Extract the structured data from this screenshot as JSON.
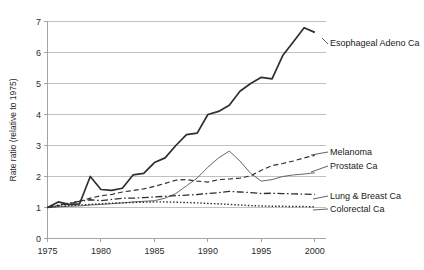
{
  "chart_data": {
    "type": "line",
    "title": "",
    "xlabel": "",
    "ylabel": "Rate ratio (relative to 1975)",
    "xlim": [
      1975,
      2001
    ],
    "ylim": [
      0,
      7
    ],
    "grid": true,
    "legend_position": "right-inline-labels",
    "x_ticks": [
      "1975",
      "1980",
      "1985",
      "1990",
      "1995",
      "2000"
    ],
    "x_tick_values": [
      1975,
      1980,
      1985,
      1990,
      1995,
      2000
    ],
    "y_ticks": [
      "0",
      "1",
      "2",
      "3",
      "4",
      "5",
      "6",
      "7"
    ],
    "y_tick_values": [
      0,
      1,
      2,
      3,
      4,
      5,
      6,
      7
    ],
    "x": [
      1975,
      1976,
      1977,
      1978,
      1979,
      1980,
      1981,
      1982,
      1983,
      1984,
      1985,
      1986,
      1987,
      1988,
      1989,
      1990,
      1991,
      1992,
      1993,
      1994,
      1995,
      1996,
      1997,
      1998,
      1999,
      2000
    ],
    "series": [
      {
        "name": "Esophageal Adeno Ca",
        "style": "solid",
        "color": "#2f2f2f",
        "width": 1.7,
        "label": "Esophageal Adeno Ca",
        "values": [
          1.0,
          1.18,
          1.1,
          1.12,
          2.0,
          1.58,
          1.55,
          1.62,
          2.05,
          2.1,
          2.45,
          2.6,
          3.0,
          3.35,
          3.4,
          4.0,
          4.1,
          4.3,
          4.75,
          5.0,
          5.2,
          5.15,
          5.9,
          6.35,
          6.8,
          6.65
        ]
      },
      {
        "name": "Melanoma",
        "style": "dashed",
        "color": "#2f2f2f",
        "width": 1.2,
        "label": "Melanoma",
        "values": [
          1.0,
          1.06,
          1.12,
          1.2,
          1.3,
          1.38,
          1.42,
          1.5,
          1.55,
          1.6,
          1.68,
          1.78,
          1.88,
          1.9,
          1.85,
          1.82,
          1.9,
          1.92,
          1.95,
          2.02,
          2.2,
          2.35,
          2.42,
          2.5,
          2.6,
          2.68
        ]
      },
      {
        "name": "Prostate Ca",
        "style": "solid-thin",
        "color": "#555555",
        "width": 0.9,
        "label": "Prostate Ca",
        "values": [
          1.0,
          1.02,
          1.04,
          1.05,
          1.08,
          1.1,
          1.12,
          1.15,
          1.18,
          1.2,
          1.22,
          1.3,
          1.45,
          1.7,
          1.95,
          2.3,
          2.6,
          2.82,
          2.5,
          2.1,
          1.85,
          1.9,
          2.0,
          2.05,
          2.08,
          2.12
        ]
      },
      {
        "name": "Lung & Breast Ca",
        "style": "dash-dot",
        "color": "#2f2f2f",
        "width": 1.3,
        "label": "Lung & Breast Ca",
        "values": [
          1.0,
          1.08,
          1.14,
          1.2,
          1.25,
          1.22,
          1.26,
          1.3,
          1.3,
          1.32,
          1.34,
          1.36,
          1.38,
          1.4,
          1.42,
          1.45,
          1.48,
          1.52,
          1.5,
          1.48,
          1.45,
          1.46,
          1.45,
          1.44,
          1.43,
          1.42
        ]
      },
      {
        "name": "Colorectal Ca",
        "style": "dotted",
        "color": "#2f2f2f",
        "width": 1.4,
        "label": "Colorectal Ca",
        "values": [
          1.0,
          1.04,
          1.06,
          1.08,
          1.1,
          1.12,
          1.14,
          1.15,
          1.16,
          1.17,
          1.18,
          1.18,
          1.17,
          1.16,
          1.15,
          1.13,
          1.12,
          1.1,
          1.08,
          1.06,
          1.05,
          1.04,
          1.04,
          1.03,
          1.03,
          1.02
        ]
      }
    ]
  },
  "axis": {
    "y_title": "Rate ratio (relative to 1975)"
  },
  "labels": {
    "esophageal": "Esophageal Adeno Ca",
    "melanoma": "Melanoma",
    "prostate": "Prostate Ca",
    "lung_breast": "Lung & Breast Ca",
    "colorectal": "Colorectal Ca"
  }
}
